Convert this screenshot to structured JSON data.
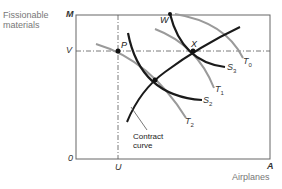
{
  "axes": {
    "y_label_line1": "Fissionable",
    "y_label_line2": "materials",
    "x_label": "Airplanes",
    "origin": "0",
    "y_max": "M",
    "x_max": "A",
    "y_ref": "V",
    "x_ref": "U"
  },
  "points": {
    "p": "P",
    "x": "X",
    "w": "W"
  },
  "curves": {
    "t0": {
      "base": "T",
      "sub": "0"
    },
    "t1": {
      "base": "T",
      "sub": "1"
    },
    "t2": {
      "base": "T",
      "sub": "2"
    },
    "s2": {
      "base": "S",
      "sub": "2"
    },
    "s3": {
      "base": "S",
      "sub": "3"
    }
  },
  "contract_curve": {
    "line1": "Contract",
    "line2": "curve"
  },
  "colors": {
    "dark_curve": "#1a1a1a",
    "grey_curve": "#9a9a9a",
    "frame": "#555555"
  }
}
